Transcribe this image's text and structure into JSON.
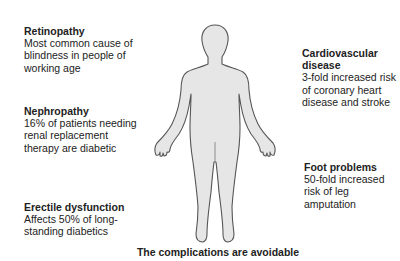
{
  "annotations": [
    {
      "id": "retinopathy",
      "title": "Retinopathy",
      "body": "Most common cause of blindness in people of working age"
    },
    {
      "id": "nephropathy",
      "title": "Nephropathy",
      "body": "16% of patients needing renal replacement therapy are diabetic"
    },
    {
      "id": "erectile-dysfunction",
      "title": "Erectile dysfunction",
      "body": "Affects 50% of long-standing diabetics"
    },
    {
      "id": "cardiovascular-disease",
      "title": "Cardiovascular disease",
      "body": "3-fold increased risk of coronary heart disease and stroke"
    },
    {
      "id": "foot-problems",
      "title": "Foot problems",
      "body": "50-fold increased risk of leg amputation"
    }
  ],
  "caption": "The complications are avoidable",
  "figure": {
    "icon": "human-body-outline-icon",
    "fill": "#e6e6e6",
    "stroke": "#555555"
  }
}
